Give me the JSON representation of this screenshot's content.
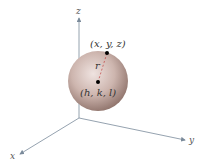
{
  "diagram": {
    "axes": {
      "x": "x",
      "y": "y",
      "z": "z"
    },
    "point_on_surface": {
      "label": "(x, y, z)"
    },
    "center": {
      "label": "(h, k, l)"
    },
    "radius_label": "r",
    "colors": {
      "sphere_center": "#e8d8d4",
      "sphere_edge": "#9c8078",
      "axis": "#7a8a9a",
      "point": "#000000",
      "radius_line": "#c04040"
    }
  }
}
